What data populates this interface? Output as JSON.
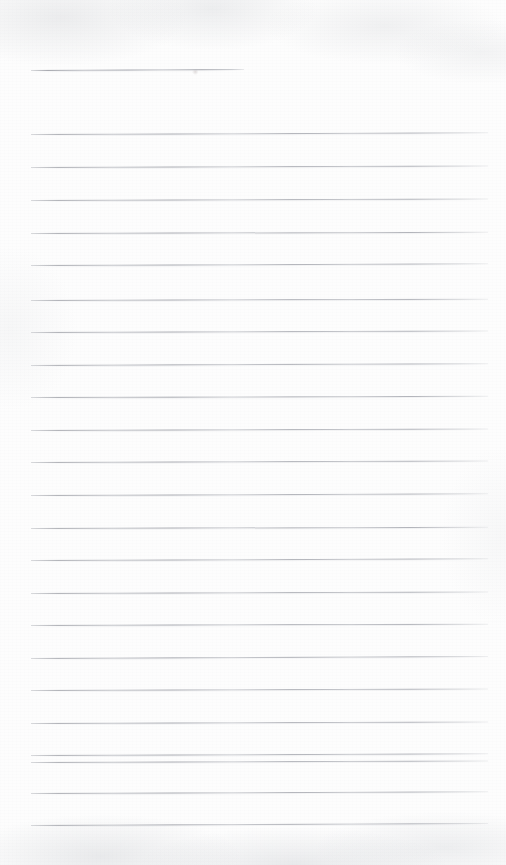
{
  "page": {
    "kind": "lined-notepad-page",
    "width": 506,
    "height": 865,
    "paper_color": "#fdfdfd",
    "rule_color": "#a8aab0",
    "texture_color": "#c4c6ca",
    "content_text": "",
    "written_text_present": false
  },
  "layout": {
    "left_margin_x": 31,
    "right_margin_x": 488,
    "line_width": 457,
    "line_spacing": 32.6,
    "first_full_line_y": 134,
    "last_full_line_y": 825,
    "full_line_count": 23,
    "header_line_count": 1
  },
  "header_rule": {
    "label": "header-rule",
    "x": 31,
    "y": 70,
    "width": 213,
    "tilt_deg": -0.25
  },
  "rules": [
    {
      "label": "rule-1",
      "y": 134,
      "x": 31,
      "width": 457,
      "tilt_deg": -0.22
    },
    {
      "label": "rule-2",
      "y": 167,
      "x": 31,
      "width": 457,
      "tilt_deg": -0.18
    },
    {
      "label": "rule-3",
      "y": 200,
      "x": 31,
      "width": 457,
      "tilt_deg": -0.2
    },
    {
      "label": "rule-4",
      "y": 233,
      "x": 31,
      "width": 457,
      "tilt_deg": -0.16
    },
    {
      "label": "rule-5",
      "y": 265,
      "x": 31,
      "width": 457,
      "tilt_deg": -0.21
    },
    {
      "label": "rule-6",
      "y": 300,
      "x": 31,
      "width": 457,
      "tilt_deg": -0.17
    },
    {
      "label": "rule-7",
      "y": 332,
      "x": 31,
      "width": 457,
      "tilt_deg": -0.19
    },
    {
      "label": "rule-8",
      "y": 365,
      "x": 31,
      "width": 457,
      "tilt_deg": -0.23
    },
    {
      "label": "rule-9",
      "y": 397,
      "x": 31,
      "width": 457,
      "tilt_deg": -0.15
    },
    {
      "label": "rule-10",
      "y": 430,
      "x": 31,
      "width": 457,
      "tilt_deg": -0.2
    },
    {
      "label": "rule-11",
      "y": 462,
      "x": 31,
      "width": 457,
      "tilt_deg": -0.18
    },
    {
      "label": "rule-12",
      "y": 495,
      "x": 31,
      "width": 457,
      "tilt_deg": -0.22
    },
    {
      "label": "rule-13",
      "y": 528,
      "x": 31,
      "width": 457,
      "tilt_deg": -0.16
    },
    {
      "label": "rule-14",
      "y": 560,
      "x": 31,
      "width": 457,
      "tilt_deg": -0.21
    },
    {
      "label": "rule-15",
      "y": 593,
      "x": 31,
      "width": 457,
      "tilt_deg": -0.19
    },
    {
      "label": "rule-16",
      "y": 625,
      "x": 31,
      "width": 457,
      "tilt_deg": -0.17
    },
    {
      "label": "rule-17",
      "y": 658,
      "x": 31,
      "width": 457,
      "tilt_deg": -0.24
    },
    {
      "label": "rule-18",
      "y": 690,
      "x": 31,
      "width": 457,
      "tilt_deg": -0.18
    },
    {
      "label": "rule-19",
      "y": 723,
      "x": 31,
      "width": 457,
      "tilt_deg": -0.2
    },
    {
      "label": "rule-20",
      "y": 755,
      "x": 31,
      "width": 457,
      "tilt_deg": -0.22
    },
    {
      "label": "rule-21",
      "y": 762,
      "x": 31,
      "width": 457,
      "tilt_deg": -0.19
    },
    {
      "label": "rule-22",
      "y": 793,
      "x": 31,
      "width": 457,
      "tilt_deg": -0.21
    },
    {
      "label": "rule-23",
      "y": 825,
      "x": 31,
      "width": 457,
      "tilt_deg": -0.26
    }
  ]
}
